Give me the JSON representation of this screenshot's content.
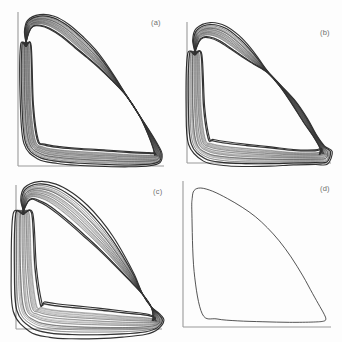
{
  "figure": {
    "title": "",
    "background_color": "#fdfdfd",
    "ink_color": "#0d0d0d",
    "axis_color": "#9a9a9a",
    "label_color": "#6e6e6e",
    "rows": 2,
    "cols": 2
  },
  "panels": [
    {
      "id": "a",
      "label": "(a)",
      "kind": "dense-braided-attractor",
      "description": "Closed trajectory bundle with broad striated upper arch, narrow waist at mid-right and thick flat band along the bottom",
      "band_count": 26,
      "band_spread": 1.0
    },
    {
      "id": "b",
      "label": "(b)",
      "kind": "dense-braided-attractor",
      "description": "Trajectory bundle with two pinch nodes producing a lens shaped bulge on the descending branch",
      "band_count": 26,
      "band_spread": 1.25
    },
    {
      "id": "c",
      "label": "(c)",
      "kind": "dense-braided-attractor",
      "description": "Trajectory bundle with a wide lens bulge on the upper descending branch and a thick lower band",
      "band_count": 26,
      "band_spread": 1.45
    },
    {
      "id": "d",
      "label": "(d)",
      "kind": "single-limit-cycle",
      "description": "Single smooth closed limit cycle, steep rise at the left axis, rounded peak and long concave descent to a hooked lower right corner",
      "band_count": 1,
      "band_spread": 0.0
    }
  ],
  "chart_data": {
    "type": "line",
    "title": "",
    "xlabel": "",
    "ylabel": "",
    "grid": false,
    "legend": null,
    "xlim": [
      0,
      1
    ],
    "ylim": [
      0,
      1
    ],
    "panel_layout": [
      "(a)",
      "(b)",
      "(c)",
      "(d)"
    ],
    "series": [
      {
        "name": "(a) attractor bundle",
        "panel": "a",
        "closed": true,
        "n_curves": 26,
        "outline_x": [
          0.055,
          0.06,
          0.085,
          0.15,
          0.23,
          0.32,
          0.42,
          0.5,
          0.57,
          0.65,
          0.74,
          0.83,
          0.9,
          0.945,
          0.96,
          0.955,
          0.9,
          0.76,
          0.6,
          0.43,
          0.28,
          0.16,
          0.09,
          0.062,
          0.055
        ],
        "outline_y": [
          0.78,
          0.87,
          0.925,
          0.945,
          0.93,
          0.88,
          0.8,
          0.73,
          0.66,
          0.57,
          0.46,
          0.33,
          0.21,
          0.12,
          0.075,
          0.055,
          0.045,
          0.045,
          0.052,
          0.06,
          0.072,
          0.095,
          0.16,
          0.4,
          0.78
        ]
      },
      {
        "name": "(b) attractor bundle",
        "panel": "b",
        "closed": true,
        "n_curves": 26,
        "outline_x": [
          0.055,
          0.062,
          0.09,
          0.16,
          0.245,
          0.33,
          0.41,
          0.48,
          0.56,
          0.65,
          0.74,
          0.82,
          0.89,
          0.94,
          0.962,
          0.955,
          0.89,
          0.74,
          0.58,
          0.41,
          0.265,
          0.15,
          0.085,
          0.06,
          0.055
        ],
        "outline_y": [
          0.77,
          0.865,
          0.92,
          0.94,
          0.915,
          0.855,
          0.785,
          0.72,
          0.645,
          0.545,
          0.43,
          0.305,
          0.19,
          0.11,
          0.07,
          0.05,
          0.042,
          0.042,
          0.048,
          0.056,
          0.068,
          0.092,
          0.155,
          0.39,
          0.77
        ]
      },
      {
        "name": "(c) attractor bundle",
        "panel": "c",
        "closed": true,
        "n_curves": 26,
        "outline_x": [
          0.05,
          0.058,
          0.085,
          0.15,
          0.24,
          0.335,
          0.43,
          0.52,
          0.61,
          0.7,
          0.79,
          0.865,
          0.925,
          0.96,
          0.972,
          0.962,
          0.89,
          0.73,
          0.56,
          0.39,
          0.25,
          0.145,
          0.082,
          0.056,
          0.05
        ],
        "outline_y": [
          0.8,
          0.89,
          0.94,
          0.955,
          0.93,
          0.87,
          0.79,
          0.7,
          0.6,
          0.485,
          0.36,
          0.245,
          0.155,
          0.095,
          0.06,
          0.042,
          0.036,
          0.036,
          0.042,
          0.05,
          0.062,
          0.088,
          0.15,
          0.42,
          0.8
        ]
      },
      {
        "name": "(d) limit cycle",
        "panel": "d",
        "closed": true,
        "n_curves": 1,
        "outline_x": [
          0.06,
          0.062,
          0.075,
          0.12,
          0.2,
          0.3,
          0.4,
          0.49,
          0.57,
          0.65,
          0.73,
          0.81,
          0.875,
          0.925,
          0.955,
          0.965,
          0.95,
          0.88,
          0.72,
          0.54,
          0.37,
          0.23,
          0.13,
          0.075,
          0.06
        ],
        "outline_y": [
          0.78,
          0.88,
          0.935,
          0.952,
          0.93,
          0.88,
          0.82,
          0.755,
          0.68,
          0.59,
          0.48,
          0.35,
          0.23,
          0.14,
          0.085,
          0.055,
          0.04,
          0.034,
          0.032,
          0.036,
          0.042,
          0.055,
          0.09,
          0.38,
          0.78
        ]
      }
    ]
  }
}
